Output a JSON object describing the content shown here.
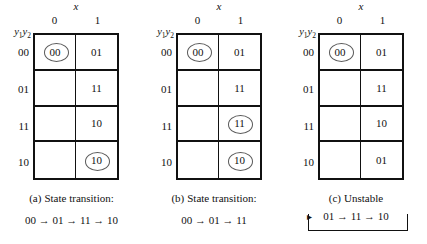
{
  "figure": {
    "x_label": "x",
    "y_label_prefix": "y",
    "y_label_sub1": "1",
    "y_label_sub2": "2",
    "column_headers": [
      "0",
      "1"
    ],
    "row_headers": [
      "00",
      "01",
      "11",
      "10"
    ],
    "arrow_glyph": "→"
  },
  "panels": [
    {
      "id": "a",
      "caption_tag": "(a)",
      "caption_text": "State transition:",
      "sequence": "00 → 01 → 11 → 10",
      "unstable_loop": false,
      "rows": [
        {
          "label": "00",
          "cells": [
            {
              "value": "00",
              "circled": true
            },
            {
              "value": "01",
              "circled": false
            }
          ]
        },
        {
          "label": "01",
          "cells": [
            {
              "value": "",
              "circled": false
            },
            {
              "value": "11",
              "circled": false
            }
          ]
        },
        {
          "label": "11",
          "cells": [
            {
              "value": "",
              "circled": false
            },
            {
              "value": "10",
              "circled": false
            }
          ]
        },
        {
          "label": "10",
          "cells": [
            {
              "value": "",
              "circled": false
            },
            {
              "value": "10",
              "circled": true
            }
          ]
        }
      ]
    },
    {
      "id": "b",
      "caption_tag": "(b)",
      "caption_text": "State transition:",
      "sequence": "00 → 01 → 11",
      "unstable_loop": false,
      "rows": [
        {
          "label": "00",
          "cells": [
            {
              "value": "00",
              "circled": true
            },
            {
              "value": "01",
              "circled": false
            }
          ]
        },
        {
          "label": "01",
          "cells": [
            {
              "value": "",
              "circled": false
            },
            {
              "value": "11",
              "circled": false
            }
          ]
        },
        {
          "label": "11",
          "cells": [
            {
              "value": "",
              "circled": false
            },
            {
              "value": "11",
              "circled": true
            }
          ]
        },
        {
          "label": "10",
          "cells": [
            {
              "value": "",
              "circled": false
            },
            {
              "value": "10",
              "circled": true
            }
          ]
        }
      ]
    },
    {
      "id": "c",
      "caption_tag": "(c)",
      "caption_text": "Unstable",
      "sequence": "01 → 11 → 10",
      "unstable_loop": true,
      "loop_arrow_head": "▸",
      "rows": [
        {
          "label": "00",
          "cells": [
            {
              "value": "00",
              "circled": true
            },
            {
              "value": "01",
              "circled": false
            }
          ]
        },
        {
          "label": "01",
          "cells": [
            {
              "value": "",
              "circled": false
            },
            {
              "value": "11",
              "circled": false
            }
          ]
        },
        {
          "label": "11",
          "cells": [
            {
              "value": "",
              "circled": false
            },
            {
              "value": "10",
              "circled": false
            }
          ]
        },
        {
          "label": "10",
          "cells": [
            {
              "value": "",
              "circled": false
            },
            {
              "value": "01",
              "circled": false
            }
          ]
        }
      ]
    }
  ]
}
